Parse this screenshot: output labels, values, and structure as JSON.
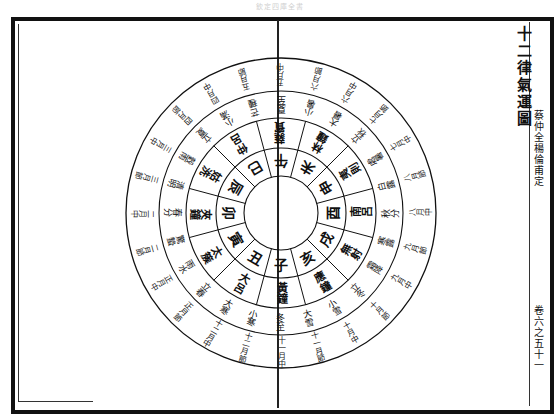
{
  "page": {
    "running_head": "欽定四庫全書",
    "title": "十二律氣運圖",
    "attribution": "蔡仲全楊倫甫定",
    "page_marker": "卷六之五十一"
  },
  "diagram": {
    "center": [
      281,
      213
    ],
    "radii": {
      "hub": 37,
      "branch_ring": 65,
      "pitch_ring": 95,
      "term_ring": 122,
      "month_ring": 155
    },
    "start_angle_deg": 90,
    "segments": [
      {
        "branch": "子",
        "pitch": "黃鐘",
        "term": "冬至",
        "month": "十一月中"
      },
      {
        "branch": "丑",
        "pitch": "大呂",
        "term": "大寒",
        "month": "十二月中"
      },
      {
        "branch": "寅",
        "pitch": "太簇",
        "term": "雨水",
        "month": "正月中"
      },
      {
        "branch": "卯",
        "pitch": "夾鐘",
        "term": "春分",
        "month": "二月中"
      },
      {
        "branch": "辰",
        "pitch": "姑洗",
        "term": "穀雨",
        "month": "三月中"
      },
      {
        "branch": "巳",
        "pitch": "仲呂",
        "term": "小滿",
        "month": "四月中"
      },
      {
        "branch": "午",
        "pitch": "蕤賓",
        "term": "夏至",
        "month": "五月中"
      },
      {
        "branch": "未",
        "pitch": "林鐘",
        "term": "大暑",
        "month": "六月中"
      },
      {
        "branch": "申",
        "pitch": "夷則",
        "term": "處暑",
        "month": "七月中"
      },
      {
        "branch": "酉",
        "pitch": "南呂",
        "term": "秋分",
        "month": "八月中"
      },
      {
        "branch": "戌",
        "pitch": "無射",
        "term": "霜降",
        "month": "九月中"
      },
      {
        "branch": "亥",
        "pitch": "應鐘",
        "term": "小雪",
        "month": "十月中"
      }
    ],
    "intermediate_terms": [
      {
        "term": "小寒",
        "month": "十二月節"
      },
      {
        "term": "立春",
        "month": "正月節"
      },
      {
        "term": "驚蟄",
        "month": "二月節"
      },
      {
        "term": "清明",
        "month": "三月節"
      },
      {
        "term": "立夏",
        "month": "四月節"
      },
      {
        "term": "芒種",
        "month": "五月節"
      },
      {
        "term": "小暑",
        "month": "六月節"
      },
      {
        "term": "立秋",
        "month": "七月節"
      },
      {
        "term": "白露",
        "month": "八月節"
      },
      {
        "term": "寒露",
        "month": "九月節"
      },
      {
        "term": "立冬",
        "month": "十月節"
      },
      {
        "term": "大雪",
        "month": "十一月節"
      }
    ],
    "colors": {
      "ink": "#111111",
      "paper": "#ffffff"
    }
  }
}
